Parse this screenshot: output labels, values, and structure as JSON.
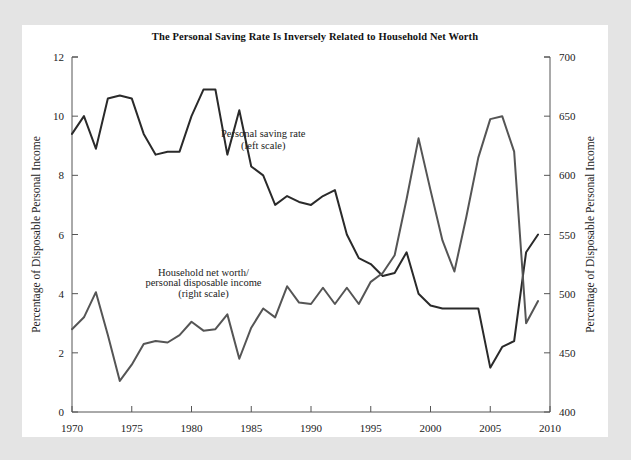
{
  "figure": {
    "background_color": "#e4e4e4",
    "panel_color": "#ffffff",
    "width": 631,
    "height": 460
  },
  "chart_data": {
    "type": "line",
    "title": "The Personal Saving Rate Is Inversely Related to Household Net Worth",
    "xlabel": "",
    "ylabel": "Percentage of Disposable Personal Income",
    "y2label": "Percentage of Disposable Personal Income",
    "xlim": [
      1970,
      2010
    ],
    "ylim": [
      0,
      12
    ],
    "y2lim": [
      400,
      700
    ],
    "xticks": [
      1970,
      1975,
      1980,
      1985,
      1990,
      1995,
      2000,
      2005,
      2010
    ],
    "xticklabels": [
      "1970",
      "1975",
      "1980",
      "1985",
      "1990",
      "1995",
      "2000",
      "2005",
      "2010"
    ],
    "yticks": [
      0,
      2,
      4,
      6,
      8,
      10,
      12
    ],
    "yticklabels": [
      "0",
      "2",
      "4",
      "6",
      "8",
      "10",
      "12"
    ],
    "y2ticks": [
      400,
      450,
      500,
      550,
      600,
      650,
      700
    ],
    "y2ticklabels": [
      "400",
      "450",
      "500",
      "550",
      "600",
      "650",
      "700"
    ],
    "xminor_interval": 1,
    "grid": false,
    "legend": "annotations",
    "line_color": "#2a2a2a",
    "secondary_line_color": "#555555",
    "x": [
      1970,
      1971,
      1972,
      1973,
      1974,
      1975,
      1976,
      1977,
      1978,
      1979,
      1980,
      1981,
      1982,
      1983,
      1984,
      1985,
      1986,
      1987,
      1988,
      1989,
      1990,
      1991,
      1992,
      1993,
      1994,
      1995,
      1996,
      1997,
      1998,
      1999,
      2000,
      2001,
      2002,
      2003,
      2004,
      2005,
      2006,
      2007,
      2008,
      2009
    ],
    "series": [
      {
        "name": "Personal saving rate",
        "axis": "left",
        "annotation": "Personal saving rate\n(left scale)",
        "color": "#2a2a2a",
        "values": [
          9.4,
          10.0,
          8.9,
          10.6,
          10.7,
          10.6,
          9.4,
          8.7,
          8.8,
          8.8,
          10.0,
          10.9,
          10.9,
          8.7,
          10.2,
          8.3,
          8.0,
          7.0,
          7.3,
          7.1,
          7.0,
          7.3,
          7.5,
          6.0,
          5.2,
          5.0,
          4.6,
          4.7,
          5.4,
          4.0,
          3.6,
          3.5,
          3.5,
          3.5,
          3.5,
          1.5,
          2.2,
          2.4,
          5.4,
          6.0
        ]
      },
      {
        "name": "Household net worth/personal disposable income",
        "axis": "right",
        "annotation": "Household net worth/\npersonal disposable income\n(right scale)",
        "color": "#555555",
        "values_left_scale": [
          2.8,
          3.2,
          4.05,
          2.6,
          1.05,
          1.6,
          2.3,
          2.4,
          2.35,
          2.6,
          3.05,
          2.75,
          2.8,
          3.3,
          1.8,
          2.85,
          3.5,
          3.2,
          4.25,
          3.7,
          3.65,
          4.2,
          3.65,
          4.2,
          3.65,
          4.4,
          4.7,
          5.3,
          7.2,
          9.25,
          7.5,
          5.8,
          4.75,
          6.6,
          8.6,
          9.9,
          10.0,
          8.8,
          3.0,
          3.75
        ],
        "values": [
          470,
          480,
          501,
          465,
          426,
          440,
          457,
          460,
          459,
          465,
          476,
          469,
          470,
          482,
          445,
          471,
          487,
          480,
          506,
          492,
          491,
          505,
          491,
          505,
          491,
          510,
          517,
          532,
          580,
          631,
          587,
          545,
          519,
          565,
          615,
          647,
          650,
          620,
          475,
          494
        ]
      }
    ],
    "annotations": [
      {
        "text": "Personal saving rate",
        "x": 1986,
        "y": 9.3
      },
      {
        "text": "(left scale)",
        "x": 1986,
        "y": 8.9
      },
      {
        "text": "Household net worth/",
        "x": 1981,
        "y": 4.6
      },
      {
        "text": "personal disposable income",
        "x": 1981,
        "y": 4.25
      },
      {
        "text": "(right scale)",
        "x": 1981,
        "y": 3.9
      }
    ]
  }
}
